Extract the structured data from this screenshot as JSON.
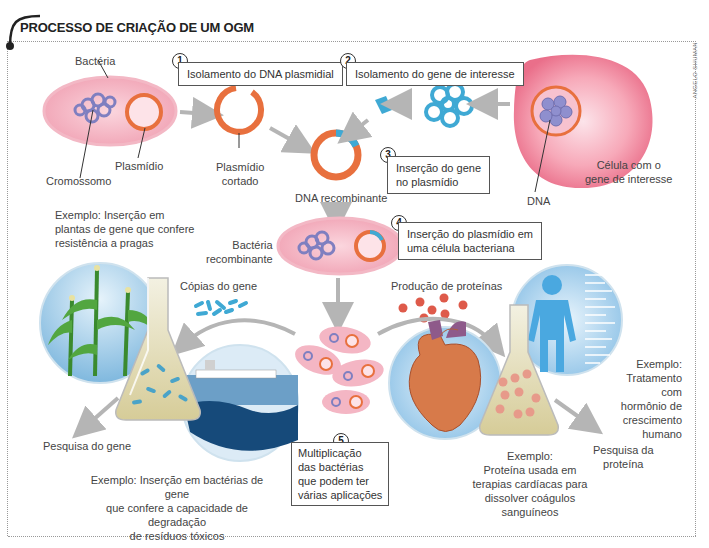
{
  "title": "PROCESSO DE CRIAÇÃO DE UM OGM",
  "credit": "ANGELO SHUMAN",
  "steps": [
    {
      "number": "1",
      "text": "Isolamento do DNA plasmidial"
    },
    {
      "number": "2",
      "text": "Isolamento do gene de interesse"
    },
    {
      "number": "3",
      "text_lines": [
        "Inserção do gene",
        "no plasmídio"
      ]
    },
    {
      "number": "4",
      "text_lines": [
        "Inserção do plasmídio em",
        "uma célula bacteriana"
      ]
    },
    {
      "number": "5",
      "text_lines": [
        "Multiplicação",
        "das bactérias",
        "que podem ter",
        "várias aplicações"
      ]
    }
  ],
  "labels": {
    "bacteria": "Bactéria",
    "cromossomo": "Cromossomo",
    "plasmidio": "Plasmídio",
    "plasmidio_cortado": [
      "Plasmídio",
      "cortado"
    ],
    "dna_recombinante": "DNA recombinante",
    "celula_gene": [
      "Célula com o",
      "gene de interesse"
    ],
    "dna": "DNA",
    "bacteria_recombinante": [
      "Bactéria",
      "recombinante"
    ],
    "copias_gene": "Cópias do gene",
    "producao_proteinas": "Produção de proteínas",
    "pesquisa_gene": "Pesquisa do gene",
    "pesquisa_proteina": [
      "Pesquisa da",
      "proteína"
    ]
  },
  "examples": {
    "plantas": [
      "Exemplo: Inserção em",
      "plantas de gene que confere",
      "resistência a pragas"
    ],
    "bacterias": [
      "Exemplo: Inserção em bactérias de gene",
      "que confere a capacidade de degradação",
      "de resíduos tóxicos"
    ],
    "proteina": [
      "Exemplo:",
      "Proteína usada em",
      "terapias cardíacas para",
      "dissolver coágulos",
      "sanguíneos"
    ],
    "hormonio": [
      "Exemplo:",
      "Tratamento com",
      "hormônio de",
      "crescimento",
      "humano"
    ]
  },
  "colors": {
    "bacteria_pink": "#f4a7b5",
    "plasmid_orange": "#e8703e",
    "gene_blue": "#3fa9d4",
    "chromosome_purple": "#7f7fc0",
    "arrow_gray": "#b5b5b5",
    "cell_pink": "#ea6f8a"
  }
}
